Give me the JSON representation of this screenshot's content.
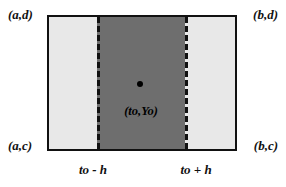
{
  "figure": {
    "corners": {
      "top_left": "(a,d)",
      "top_right": "(b,d)",
      "bottom_left": "(a,c)",
      "bottom_right": "(b,c)"
    },
    "center_point_label": "(to,Yo)",
    "ticks": {
      "left": "to - h",
      "right": "to + h"
    },
    "colors": {
      "outer_region": "#e8e8e8",
      "strip_region": "#6e6e6e",
      "border": "#111111",
      "dashed_line": "#111111",
      "point": "#000000",
      "background": "#ffffff"
    }
  }
}
